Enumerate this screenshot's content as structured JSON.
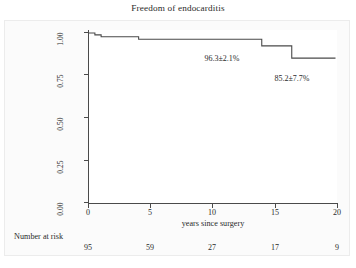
{
  "chart_data": {
    "type": "line",
    "title": "Freedom of endocarditis",
    "xlabel": "years since surgery",
    "ylabel": "",
    "xlim": [
      0,
      20
    ],
    "ylim": [
      0,
      1.0
    ],
    "grid": false,
    "legend": "none",
    "curve_style": "kaplan-meier step function",
    "xticks": [
      0,
      5,
      10,
      15,
      20
    ],
    "xtick_labels": [
      "0",
      "5",
      "10",
      "15",
      "20"
    ],
    "yticks": [
      0.0,
      0.25,
      0.5,
      0.75,
      1.0
    ],
    "ytick_labels": [
      "0.00",
      "0.25",
      "0.50",
      "0.75",
      "1.00"
    ],
    "series": [
      {
        "name": "Freedom of endocarditis",
        "color": "#4a4a4a",
        "steps": [
          {
            "x": 0.0,
            "y": 1.0
          },
          {
            "x": 0.55,
            "y": 0.989
          },
          {
            "x": 1.05,
            "y": 0.978
          },
          {
            "x": 4.05,
            "y": 0.963
          },
          {
            "x": 13.9,
            "y": 0.924
          },
          {
            "x": 16.3,
            "y": 0.852
          },
          {
            "x": 19.8,
            "y": 0.852
          }
        ]
      }
    ],
    "annotations": [
      {
        "id": "estimate-10yr",
        "text": "96.3±2.1%",
        "x_px": 222,
        "y_px": 58
      },
      {
        "id": "estimate-20yr",
        "text": "85.2±7.7%",
        "x_px": 292,
        "y_px": 78
      }
    ],
    "risk_table": {
      "title": "Number at risk",
      "times": [
        0,
        5,
        10,
        15,
        20
      ],
      "counts": [
        "95",
        "59",
        "27",
        "17",
        "9"
      ]
    }
  }
}
